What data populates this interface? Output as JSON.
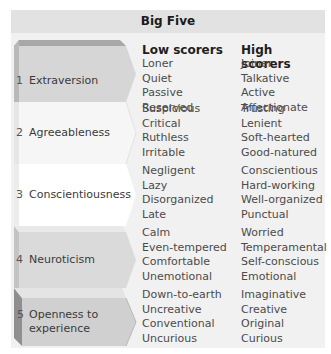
{
  "table": {
    "title": "Big Five",
    "columns": {
      "low": "Low scorers",
      "high": "High scorers"
    },
    "traits": [
      {
        "number": "1",
        "name": "Extraversion",
        "low": [
          "Loner",
          "Quiet",
          "Passive",
          "Reserved"
        ],
        "high": [
          "Joiner",
          "Talkative",
          "Active",
          "Affectionate"
        ]
      },
      {
        "number": "2",
        "name": "Agreeableness",
        "low": [
          "Suspicious",
          "Critical",
          "Ruthless",
          "Irritable"
        ],
        "high": [
          "Trusting",
          "Lenient",
          "Soft-hearted",
          "Good-natured"
        ]
      },
      {
        "number": "3",
        "name": "Conscientiousness",
        "low": [
          "Negligent",
          "Lazy",
          "Disorganized",
          "Late"
        ],
        "high": [
          "Conscientious",
          "Hard-working",
          "Well-organized",
          "Punctual"
        ]
      },
      {
        "number": "4",
        "name": "Neuroticism",
        "low": [
          "Calm",
          "Even-tempered",
          "Comfortable",
          "Unemotional"
        ],
        "high": [
          "Worried",
          "Temperamental",
          "Self-conscious",
          "Emotional"
        ]
      },
      {
        "number": "5",
        "name_line1": "Openness to",
        "name_line2": "experience",
        "low": [
          "Down-to-earth",
          "Uncreative",
          "Conventional",
          "Uncurious"
        ],
        "high": [
          "Imaginative",
          "Creative",
          "Original",
          "Curious"
        ]
      }
    ]
  },
  "colors": {
    "panel_bg": "#f1f1f1",
    "header_bg": "#e2e2e2",
    "trait1_face": "#d6d6d6",
    "trait2_face": "#f4f4f4",
    "trait3_face": "#ffffff",
    "trait4_face": "#dadada",
    "trait5_face": "#cfcfcf"
  }
}
